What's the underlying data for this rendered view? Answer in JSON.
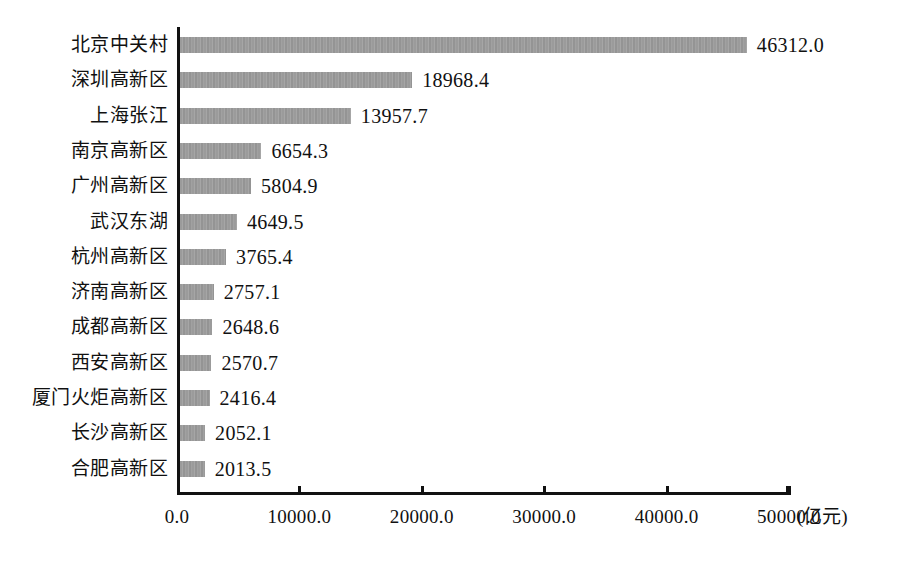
{
  "chart_data": {
    "type": "bar",
    "orientation": "horizontal",
    "title": "",
    "subtitle": "",
    "xlabel": "(亿元)",
    "ylabel": "",
    "xlim": [
      0,
      50000
    ],
    "grid": false,
    "legend": null,
    "value_format": "one-decimal",
    "unit_label": "(亿元)",
    "categories": [
      "北京中关村",
      "深圳高新区",
      "上海张江",
      "南京高新区",
      "广州高新区",
      "武汉东湖",
      "杭州高新区",
      "济南高新区",
      "成都高新区",
      "西安高新区",
      "厦门火炬高新区",
      "长沙高新区",
      "合肥高新区"
    ],
    "values": [
      46312.0,
      18968.4,
      13957.7,
      6654.3,
      5804.9,
      4649.5,
      3765.4,
      2757.1,
      2648.6,
      2570.7,
      2416.4,
      2052.1,
      2013.5
    ],
    "value_labels": [
      "46312.0",
      "18968.4",
      "13957.7",
      "6654.3",
      "5804.9",
      "4649.5",
      "3765.4",
      "2757.1",
      "2648.6",
      "2570.7",
      "2416.4",
      "2052.1",
      "2013.5"
    ],
    "xticks": [
      0,
      10000,
      20000,
      30000,
      40000,
      50000
    ],
    "xtick_labels": [
      "0.0",
      "10000.0",
      "20000.0",
      "30000.0",
      "40000.0",
      "50000.0"
    ],
    "colors": {
      "bar": "#9c9c9c",
      "axis": "#111111",
      "text": "#111111",
      "background": "#ffffff"
    }
  }
}
